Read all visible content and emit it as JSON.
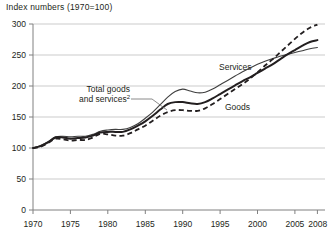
{
  "chart": {
    "title": "Index numbers (1970=100)"
  },
  "chart_data": {
    "type": "line",
    "title": "Index numbers (1970=100)",
    "xlabel": "",
    "ylabel": "",
    "xlim": [
      1970,
      2008
    ],
    "ylim": [
      0,
      300
    ],
    "yticks": [
      0,
      50,
      100,
      150,
      200,
      250,
      300
    ],
    "xticks": [
      1970,
      1975,
      1980,
      1985,
      1990,
      1995,
      2000,
      2005,
      2008
    ],
    "grid": "horizontal",
    "legend_position": "inline-annotations",
    "x": [
      1970,
      1971,
      1972,
      1973,
      1974,
      1975,
      1976,
      1977,
      1978,
      1979,
      1980,
      1981,
      1982,
      1983,
      1984,
      1985,
      1986,
      1987,
      1988,
      1989,
      1990,
      1991,
      1992,
      1993,
      1994,
      1995,
      1996,
      1997,
      1998,
      1999,
      2000,
      2001,
      2002,
      2003,
      2004,
      2005,
      2006,
      2007,
      2008
    ],
    "series": [
      {
        "name": "Services",
        "style": "solid-thin",
        "color": "#3f3f3f",
        "values": [
          100,
          104,
          110,
          118,
          119,
          118,
          119,
          119,
          122,
          127,
          129,
          130,
          130,
          133,
          139,
          148,
          158,
          170,
          182,
          191,
          195,
          192,
          189,
          190,
          195,
          202,
          209,
          216,
          223,
          229,
          235,
          240,
          244,
          248,
          251,
          254,
          257,
          260,
          262
        ]
      },
      {
        "name": "Total goods and services",
        "style": "solid-thick",
        "color": "#231f20",
        "values": [
          100,
          103,
          109,
          117,
          117,
          115,
          116,
          117,
          120,
          125,
          126,
          126,
          126,
          130,
          136,
          143,
          152,
          162,
          171,
          174,
          174,
          172,
          171,
          174,
          180,
          187,
          194,
          201,
          208,
          214,
          221,
          228,
          235,
          243,
          251,
          258,
          265,
          271,
          274
        ]
      },
      {
        "name": "Goods",
        "style": "dashed",
        "color": "#231f20",
        "values": [
          100,
          102,
          108,
          115,
          114,
          112,
          113,
          113,
          117,
          123,
          122,
          120,
          120,
          124,
          130,
          136,
          144,
          152,
          158,
          161,
          161,
          160,
          160,
          164,
          171,
          179,
          187,
          195,
          203,
          212,
          222,
          233,
          243,
          254,
          265,
          276,
          286,
          294,
          299
        ]
      }
    ],
    "annotations": [
      {
        "label": "Services",
        "x": 1994.0,
        "y": 230
      },
      {
        "label": "Total goods and services",
        "footnote": "2",
        "x": 1982.0,
        "y": 186
      },
      {
        "label": "Goods",
        "x": 1995.5,
        "y": 165
      }
    ]
  },
  "axis": {
    "y_labels": [
      "300",
      "250",
      "200",
      "150",
      "100",
      "50",
      "0"
    ],
    "x_labels": [
      "1970",
      "1975",
      "1980",
      "1985",
      "1990",
      "1995",
      "2000",
      "2005",
      "2008"
    ]
  },
  "annotations": {
    "services": "Services",
    "goods": "Goods",
    "total_line1": "Total goods",
    "total_line2": "and services",
    "total_footnote": "2"
  },
  "colors": {
    "axis": "#808080",
    "grid": "#b5b5b5",
    "ink": "#231f20",
    "services_line": "#3f3f3f"
  }
}
